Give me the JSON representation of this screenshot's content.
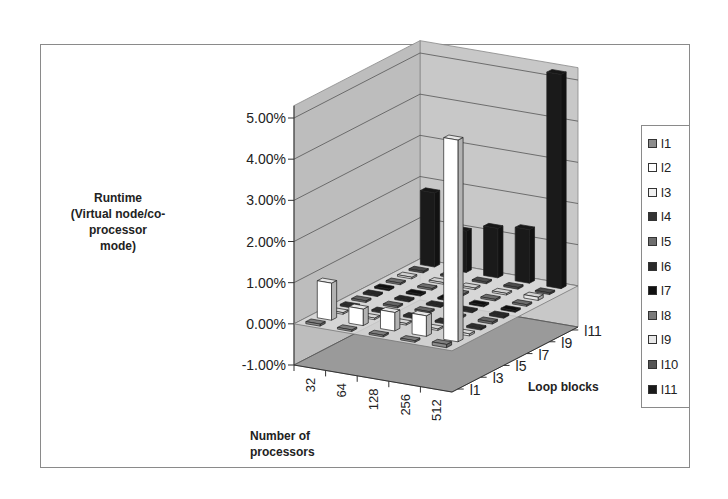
{
  "chart_data": {
    "type": "bar",
    "subtype": "3d-column",
    "title": "",
    "ylabel": "Runtime (Virtual node/co-processor mode)",
    "xlabel": "Number of processors",
    "zlabel": "Loop blocks",
    "ylim": [
      -0.01,
      0.05
    ],
    "y_ticks": [
      "-1.00%",
      "0.00%",
      "1.00%",
      "2.00%",
      "3.00%",
      "4.00%",
      "5.00%"
    ],
    "categories": [
      "32",
      "64",
      "128",
      "256",
      "512"
    ],
    "depth_tick_labels": [
      "l1",
      "l3",
      "l5",
      "l7",
      "l9",
      "l11"
    ],
    "legend_position": "right",
    "grid": true,
    "series": [
      {
        "name": "l1",
        "color": "#8c8c8c",
        "values": [
          0.0005,
          0.0003,
          0.0003,
          0.0003,
          0.0008
        ]
      },
      {
        "name": "l2",
        "color": "#ffffff",
        "values": [
          0.009,
          0.004,
          0.0045,
          0.005,
          0.049
        ]
      },
      {
        "name": "l3",
        "color": "#f0f0f0",
        "values": [
          0.0003,
          0.0003,
          0.0003,
          0.0003,
          0.0005
        ]
      },
      {
        "name": "l4",
        "color": "#333333",
        "values": [
          0.0003,
          0.0003,
          0.0003,
          0.0003,
          0.0003
        ]
      },
      {
        "name": "l5",
        "color": "#6e6e6e",
        "values": [
          0.0003,
          0.0003,
          0.0003,
          0.0003,
          0.0005
        ]
      },
      {
        "name": "l6",
        "color": "#2a2a2a",
        "values": [
          0.0003,
          0.0003,
          0.0003,
          0.0003,
          0.0005
        ]
      },
      {
        "name": "l7",
        "color": "#111111",
        "values": [
          0.0003,
          0.0003,
          0.0003,
          0.0003,
          0.0003
        ]
      },
      {
        "name": "l8",
        "color": "#7a7a7a",
        "values": [
          0.0003,
          0.0003,
          0.0003,
          0.0003,
          0.0003
        ]
      },
      {
        "name": "l9",
        "color": "#e8e8e8",
        "values": [
          0.0003,
          0.0003,
          0.0003,
          0.0003,
          0.0008
        ]
      },
      {
        "name": "l10",
        "color": "#555555",
        "values": [
          0.0003,
          0.0003,
          0.0003,
          0.0003,
          0.0003
        ]
      },
      {
        "name": "l11",
        "color": "#1a1a1a",
        "values": [
          0.018,
          0.01,
          0.012,
          0.013,
          0.052
        ]
      }
    ]
  },
  "axis": {
    "y_title_lines": [
      "Runtime",
      "(Virtual node/co-",
      "processor",
      "mode)"
    ],
    "x_title_lines": [
      "Number of",
      "processors"
    ],
    "z_title": "Loop blocks"
  },
  "legend": {
    "items": [
      {
        "label": "l1",
        "color": "#8c8c8c"
      },
      {
        "label": "l2",
        "color": "#ffffff"
      },
      {
        "label": "l3",
        "color": "#f0f0f0"
      },
      {
        "label": "l4",
        "color": "#333333"
      },
      {
        "label": "l5",
        "color": "#6e6e6e"
      },
      {
        "label": "l6",
        "color": "#2a2a2a"
      },
      {
        "label": "l7",
        "color": "#111111"
      },
      {
        "label": "l8",
        "color": "#7a7a7a"
      },
      {
        "label": "l9",
        "color": "#e8e8e8"
      },
      {
        "label": "l10",
        "color": "#555555"
      },
      {
        "label": "l11",
        "color": "#1a1a1a"
      }
    ]
  }
}
